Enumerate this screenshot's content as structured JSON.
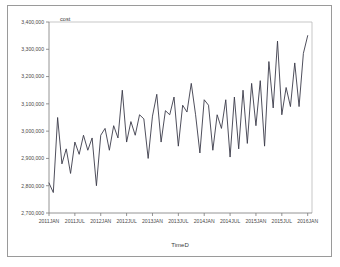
{
  "figure": {
    "background_color": "#ffffff",
    "border_color": "#9a9a9a",
    "plot_frame_color": "#b9b9b9",
    "line_color": "#3b3b4a",
    "axis_color": "#7a7a7a"
  },
  "chart_data": {
    "type": "line",
    "title": "",
    "subtitle": "",
    "ylabel": "cost",
    "xlabel": "TimeD",
    "grid": false,
    "legend": "none",
    "ylim": [
      2700000,
      3400000
    ],
    "ytick_labels": [
      "3,400,000",
      "3,300,000",
      "3,200,000",
      "3,100,000",
      "3,000,000",
      "2,900,000",
      "2,800,000",
      "2,700,000"
    ],
    "ytick_values": [
      3400000,
      3300000,
      3200000,
      3100000,
      3000000,
      2900000,
      2800000,
      2700000
    ],
    "xtick_labels": [
      "2011JAN",
      "2011JUL",
      "2012JAN",
      "2012JUL",
      "2013JAN",
      "2013JUL",
      "2014JAN",
      "2014JUL",
      "2015JAN",
      "2015JUL",
      "2016JAN"
    ],
    "xtick_index": [
      0,
      6,
      12,
      18,
      24,
      30,
      36,
      42,
      48,
      54,
      60
    ],
    "xlim_index": [
      0,
      61
    ],
    "series": [
      {
        "name": "cost",
        "x": [
          "2011JAN",
          "2011FEB",
          "2011MAR",
          "2011APR",
          "2011MAY",
          "2011JUN",
          "2011JUL",
          "2011AUG",
          "2011SEP",
          "2011OCT",
          "2011NOV",
          "2011DEC",
          "2012JAN",
          "2012FEB",
          "2012MAR",
          "2012APR",
          "2012MAY",
          "2012JUN",
          "2012JUL",
          "2012AUG",
          "2012SEP",
          "2012OCT",
          "2012NOV",
          "2012DEC",
          "2013JAN",
          "2013FEB",
          "2013MAR",
          "2013APR",
          "2013MAY",
          "2013JUN",
          "2013JUL",
          "2013AUG",
          "2013SEP",
          "2013OCT",
          "2013NOV",
          "2013DEC",
          "2014JAN",
          "2014FEB",
          "2014MAR",
          "2014APR",
          "2014MAY",
          "2014JUN",
          "2014JUL",
          "2014AUG",
          "2014SEP",
          "2014OCT",
          "2014NOV",
          "2014DEC",
          "2015JAN",
          "2015FEB",
          "2015MAR",
          "2015APR",
          "2015MAY",
          "2015JUN",
          "2015JUL",
          "2015AUG",
          "2015SEP",
          "2015OCT",
          "2015NOV",
          "2015DEC",
          "2016JAN"
        ],
        "values": [
          2810000,
          2775000,
          3050000,
          2880000,
          2935000,
          2845000,
          2960000,
          2915000,
          2985000,
          2930000,
          2975000,
          2800000,
          2985000,
          3010000,
          2930000,
          3020000,
          2975000,
          3150000,
          2960000,
          3035000,
          2985000,
          3060000,
          3045000,
          2900000,
          3055000,
          3135000,
          2960000,
          3075000,
          3060000,
          3125000,
          2945000,
          3095000,
          3070000,
          3175000,
          3060000,
          2920000,
          3115000,
          3095000,
          2930000,
          3060000,
          3010000,
          3115000,
          2905000,
          3125000,
          2935000,
          3150000,
          2955000,
          3175000,
          3020000,
          3185000,
          2945000,
          3255000,
          3085000,
          3330000,
          3060000,
          3160000,
          3090000,
          3250000,
          3090000,
          3285000,
          3350000
        ]
      }
    ]
  }
}
